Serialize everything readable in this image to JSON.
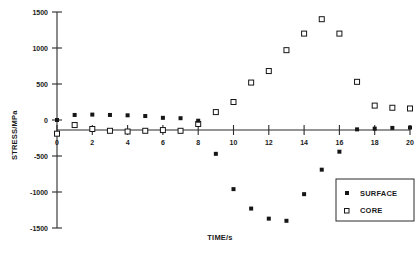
{
  "chart_data": {
    "type": "scatter",
    "title": "",
    "xlabel": "TIME/s",
    "ylabel": "STRESS/MPa",
    "xlim": [
      0,
      20
    ],
    "ylim": [
      -1500,
      1500
    ],
    "xticks": [
      0,
      2,
      4,
      6,
      8,
      10,
      12,
      14,
      16,
      18,
      20
    ],
    "xtick_labels": [
      "0",
      "2",
      "4",
      "6",
      "8",
      "10",
      "12",
      "14",
      "16",
      "18",
      "20"
    ],
    "yticks": [
      -1500,
      -1000,
      -500,
      0,
      500,
      1000,
      1500
    ],
    "ytick_labels": [
      "-1500",
      "-1000",
      "-500",
      "0",
      "500",
      "1000",
      "1500"
    ],
    "grid": false,
    "legend_position": "lower-right",
    "x": [
      0,
      1,
      2,
      3,
      4,
      5,
      6,
      7,
      8,
      9,
      10,
      11,
      12,
      13,
      14,
      15,
      16,
      17,
      18,
      19,
      20
    ],
    "series": [
      {
        "name": "SURFACE",
        "marker": "filled-square",
        "values": [
          0,
          70,
          75,
          70,
          65,
          55,
          30,
          25,
          -10,
          -470,
          -960,
          -1230,
          -1370,
          -1400,
          -1030,
          -690,
          -440,
          -130,
          -120,
          -110,
          -105
        ]
      },
      {
        "name": "CORE",
        "marker": "open-square",
        "values": [
          -190,
          -70,
          -125,
          -150,
          -160,
          -150,
          -140,
          -150,
          -55,
          110,
          250,
          520,
          680,
          970,
          1200,
          1400,
          1200,
          530,
          200,
          170,
          160
        ]
      }
    ]
  },
  "legend": {
    "entries": [
      {
        "label": "SURFACE",
        "marker": "filled-square"
      },
      {
        "label": "CORE",
        "marker": "open-square"
      }
    ]
  },
  "colors": {
    "axis": "#2b2b2b",
    "surface_marker": "#161616",
    "core_marker_stroke": "#161616",
    "core_marker_fill": "#ffffff",
    "background": "#ffffff"
  }
}
